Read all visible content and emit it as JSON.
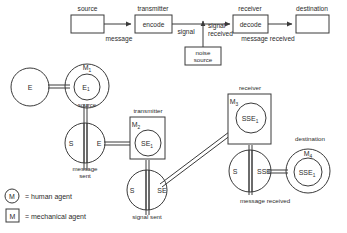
{
  "top_model": {
    "nodes": [
      {
        "id": "source",
        "label": "source",
        "box_text": ""
      },
      {
        "id": "transmitter",
        "label": "transmitter",
        "box_text": "encode"
      },
      {
        "id": "receiver",
        "label": "receiver",
        "box_text": "decode"
      },
      {
        "id": "destination",
        "label": "destination",
        "box_text": ""
      },
      {
        "id": "noise",
        "label": "",
        "box_text": "noise source"
      }
    ],
    "edge_labels": [
      {
        "id": "message",
        "text": "message"
      },
      {
        "id": "signal",
        "text": "signal"
      },
      {
        "id": "signal-received-line1",
        "text": "signal"
      },
      {
        "id": "signal-received-line2",
        "text": "received"
      },
      {
        "id": "message-received",
        "text": "message received"
      }
    ],
    "noise_box": {
      "line1": "noise",
      "line2": "source"
    }
  },
  "lower_model": {
    "captions": {
      "source": "source",
      "transmitter": "transmitter",
      "receiver": "receiver",
      "destination": "destination",
      "message_sent_line1": "message",
      "message_sent_line2": "sent",
      "signal_sent": "signal sent",
      "message_received": "message received"
    },
    "nodes": {
      "e_circle": {
        "label": "E"
      },
      "source_outer": {
        "agent": "M",
        "agent_index": "1"
      },
      "source_inner": {
        "base": "E",
        "index": "1"
      },
      "message_sent": {
        "left": "S",
        "right": "E"
      },
      "transmitter_box": {
        "agent": "M",
        "agent_index": "2"
      },
      "transmitter_inner": {
        "base": "SE",
        "index": "1"
      },
      "signal_sent": {
        "left": "S",
        "right": "SE"
      },
      "receiver_box": {
        "agent": "M",
        "agent_index": "3"
      },
      "receiver_inner": {
        "base": "SSE",
        "index": "1"
      },
      "message_received": {
        "left": "S",
        "right": "SSE"
      },
      "destination_outer": {
        "agent": "M",
        "agent_index": "4"
      },
      "destination_inner": {
        "base": "SSE",
        "index": "1"
      }
    }
  },
  "legend": {
    "items": [
      {
        "symbol": "M",
        "shape": "circle",
        "text": "= human agent"
      },
      {
        "symbol": "M",
        "shape": "square",
        "text": "= mechanical agent"
      }
    ]
  },
  "colors": {
    "stroke": "#3a3a3a",
    "text": "#2b2b2b",
    "background": "#ffffff"
  }
}
